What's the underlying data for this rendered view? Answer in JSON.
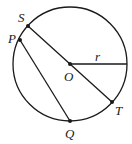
{
  "diagram": {
    "type": "circle-geometry",
    "circle": {
      "center_label": "O",
      "radius_label": "r"
    },
    "points": {
      "S": {
        "label": "S"
      },
      "P": {
        "label": "P"
      },
      "O": {
        "label": "O"
      },
      "T": {
        "label": "T"
      },
      "Q": {
        "label": "Q"
      }
    },
    "segments": [
      {
        "from": "S",
        "to": "T",
        "description": "diameter through O"
      },
      {
        "from": "P",
        "to": "Q",
        "description": "chord"
      },
      {
        "from": "O",
        "to": "circle",
        "label": "r",
        "description": "radius"
      }
    ],
    "colors": {
      "stroke": "#1a1a1a",
      "background": "#ffffff"
    }
  }
}
